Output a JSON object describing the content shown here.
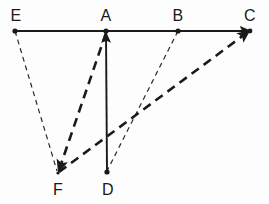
{
  "figure": {
    "type": "geometry-diagram",
    "width": 269,
    "height": 204,
    "background_color": "#fdfdfd",
    "stroke_color": "#1a1a1a",
    "points": [
      {
        "id": "E",
        "label": "E",
        "x": 15,
        "y": 31,
        "label_x": 16,
        "label_y": 16,
        "marker": "dot"
      },
      {
        "id": "A",
        "label": "A",
        "x": 106,
        "y": 31,
        "label_x": 106,
        "label_y": 16,
        "marker": "dot"
      },
      {
        "id": "B",
        "label": "B",
        "x": 178,
        "y": 31,
        "label_x": 178,
        "label_y": 16,
        "marker": "dot"
      },
      {
        "id": "C",
        "label": "C",
        "x": 250,
        "y": 31,
        "label_x": 250,
        "label_y": 16,
        "marker": "arrow"
      },
      {
        "id": "F",
        "label": "F",
        "x": 58,
        "y": 173,
        "label_x": 58,
        "label_y": 190,
        "marker": "arrow"
      },
      {
        "id": "D",
        "label": "D",
        "x": 107,
        "y": 173,
        "label_x": 108,
        "label_y": 190,
        "marker": "dot"
      }
    ],
    "segments": [
      {
        "id": "EC",
        "from": "E",
        "to": "C",
        "style": "solid",
        "weight": "medium",
        "arrow": "none"
      },
      {
        "id": "DA",
        "from": "D",
        "to": "A",
        "style": "solid",
        "weight": "medium",
        "arrow": "end"
      },
      {
        "id": "EF",
        "from": "E",
        "to": "F",
        "style": "dashed-thin",
        "weight": "thin",
        "arrow": "none"
      },
      {
        "id": "BD",
        "from": "B",
        "to": "D",
        "style": "dashed-thin",
        "weight": "thin",
        "arrow": "none"
      },
      {
        "id": "AF",
        "from": "A",
        "to": "F",
        "style": "dashed-thick",
        "weight": "thick",
        "arrow": "end"
      },
      {
        "id": "FC",
        "from": "F",
        "to": "C",
        "style": "dashed-thick",
        "weight": "thick",
        "arrow": "end"
      }
    ]
  }
}
